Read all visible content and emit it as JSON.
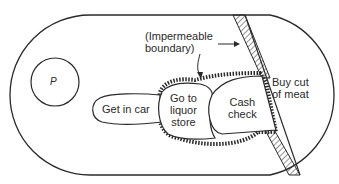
{
  "diagram": {
    "type": "life-space region diagram",
    "person_label": "P",
    "boundary_label": "(Impermeable\nboundary)",
    "regions": [
      {
        "id": "get-in-car",
        "label": "Get in car"
      },
      {
        "id": "go-to-liquor-store",
        "label": "Go to\nliquor\nstore"
      },
      {
        "id": "cash-check",
        "label": "Cash\ncheck"
      },
      {
        "id": "buy-cut-of-meat",
        "label": "Buy cut\nof meat"
      }
    ],
    "colors": {
      "stroke": "#2a2a2a",
      "background": "#ffffff"
    }
  }
}
